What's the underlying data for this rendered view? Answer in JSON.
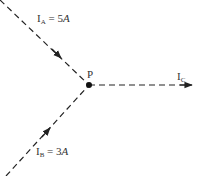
{
  "diagram": {
    "type": "current-junction",
    "node": {
      "label": "P",
      "x": 89,
      "y": 85
    },
    "branches": [
      {
        "id": "A",
        "symbol": "I",
        "subscript": "A",
        "equals": " = ",
        "value": "5",
        "unit": "A",
        "direction": "into-node",
        "from": [
          0,
          0
        ],
        "to": [
          89,
          85
        ]
      },
      {
        "id": "B",
        "symbol": "I",
        "subscript": "B",
        "equals": " = ",
        "value": "3",
        "unit": "A",
        "direction": "into-node",
        "from": [
          6,
          176
        ],
        "to": [
          89,
          85
        ]
      },
      {
        "id": "C",
        "symbol": "I",
        "subscript": "C",
        "equals": "",
        "value": "",
        "unit": "",
        "direction": "out-of-node",
        "from": [
          89,
          85
        ],
        "to": [
          190,
          85
        ]
      }
    ],
    "colors": {
      "line": "#222222",
      "text": "#333333",
      "background": "#ffffff"
    }
  }
}
